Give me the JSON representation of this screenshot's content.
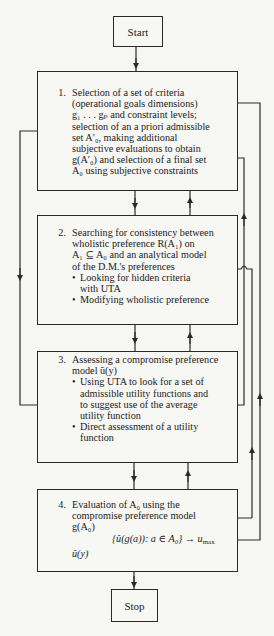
{
  "start": {
    "label": "Start"
  },
  "stop": {
    "label": "Stop"
  },
  "steps": [
    {
      "number": "1.",
      "lines": [
        "Selection of a set of criteria",
        "(operational goals dimensions)",
        "g₁ . . . gₚ and constraint levels;",
        "selection of an a priori admissible",
        "set A′₀, making additional",
        "subjective evaluations to obtain",
        "g(A′₀) and selection of a final set",
        "A₀ using subjective constraints"
      ]
    },
    {
      "number": "2.",
      "lines": [
        "Searching for consistency between",
        "wholistic preference R(A₁) on",
        "A₁ ⊆ A₀ and an analytical model",
        "of the D.M.'s preferences"
      ],
      "bullets": [
        [
          "Looking for hidden criteria",
          "with UTA"
        ],
        [
          "Modifying wholistic preference"
        ]
      ]
    },
    {
      "number": "3.",
      "lines": [
        "Assessing a compromise preference",
        "model ũ(y)"
      ],
      "bullets": [
        [
          "Using UTA to look for a set of",
          "admissible utility functions and",
          "to suggest use of the average",
          "utility function"
        ],
        [
          "Direct assessment of a utility",
          "function"
        ]
      ]
    },
    {
      "number": "4.",
      "lines": [
        "Evaluation of A₀ using the",
        "compromise preference model",
        "g(A₀)"
      ],
      "formula": "{û(g(a)): a ∈ A₀} → u",
      "formula_sub": "max",
      "tail": "û(y)"
    }
  ],
  "colors": {
    "line": "#2a2a2a",
    "background": "#f6f6f3"
  }
}
